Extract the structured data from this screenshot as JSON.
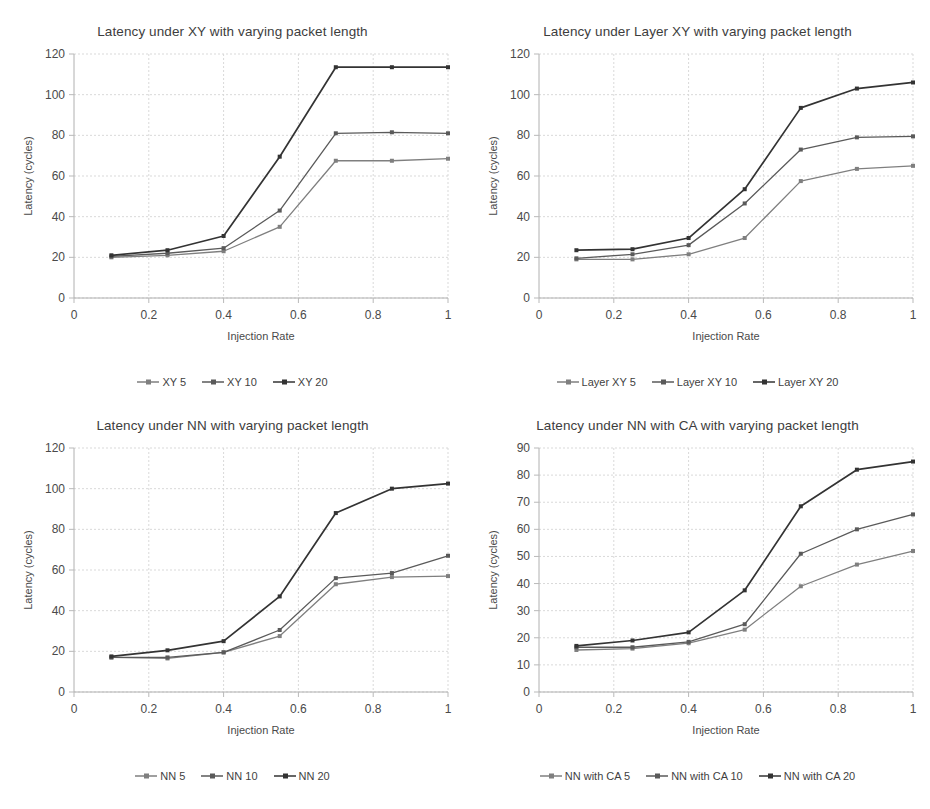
{
  "figure": {
    "background": "#ffffff",
    "series_colors": [
      "#7f7f7f",
      "#5a5a5a",
      "#333333"
    ]
  },
  "charts": [
    {
      "id": "latency-xy",
      "chart_data": {
        "type": "line",
        "title": "Latency under XY with varying packet length",
        "xlabel": "Injection Rate",
        "ylabel": "Latency (cycles)",
        "x": [
          0.1,
          0.25,
          0.4,
          0.55,
          0.7,
          0.85,
          1
        ],
        "xticks": [
          "0",
          "0.2",
          "0.4",
          "0.6",
          "0.8",
          "1"
        ],
        "xtick_values": [
          0,
          0.2,
          0.4,
          0.6,
          0.8,
          1
        ],
        "xlim": [
          0,
          1
        ],
        "yticks": [
          "0",
          "20",
          "40",
          "60",
          "80",
          "100",
          "120"
        ],
        "ytick_values": [
          0,
          20,
          40,
          60,
          80,
          100,
          120
        ],
        "ylim": [
          0,
          120
        ],
        "grid": true,
        "legend_position": "bottom",
        "series": [
          {
            "name": "XY 5",
            "values": [
              20,
              21,
              23,
              35,
              67.5,
              67.5,
              68.5
            ],
            "color": "#7f7f7f"
          },
          {
            "name": "XY 10",
            "values": [
              20.5,
              22,
              24.5,
              43,
              81,
              81.5,
              81
            ],
            "color": "#5a5a5a"
          },
          {
            "name": "XY 20",
            "values": [
              21,
              23.5,
              30.5,
              69.5,
              113.5,
              113.5,
              113.5
            ],
            "color": "#333333"
          }
        ]
      }
    },
    {
      "id": "latency-layer-xy",
      "chart_data": {
        "type": "line",
        "title": "Latency under Layer XY with varying packet length",
        "xlabel": "Injection Rate",
        "ylabel": "Latency (cycles)",
        "x": [
          0.1,
          0.25,
          0.4,
          0.55,
          0.7,
          0.85,
          1
        ],
        "xticks": [
          "0",
          "0.2",
          "0.4",
          "0.6",
          "0.8",
          "1"
        ],
        "xtick_values": [
          0,
          0.2,
          0.4,
          0.6,
          0.8,
          1
        ],
        "xlim": [
          0,
          1
        ],
        "yticks": [
          "0",
          "20",
          "40",
          "60",
          "80",
          "100",
          "120"
        ],
        "ytick_values": [
          0,
          20,
          40,
          60,
          80,
          100,
          120
        ],
        "ylim": [
          0,
          120
        ],
        "grid": true,
        "legend_position": "bottom",
        "series": [
          {
            "name": "Layer XY 5",
            "values": [
              19,
              19,
              21.5,
              29.5,
              57.5,
              63.5,
              65
            ],
            "color": "#7f7f7f"
          },
          {
            "name": "Layer XY 10",
            "values": [
              19.5,
              21.5,
              26,
              46.5,
              73,
              79,
              79.5
            ],
            "color": "#5a5a5a"
          },
          {
            "name": "Layer XY 20",
            "values": [
              23.5,
              24,
              29.5,
              53.5,
              93.5,
              103,
              106
            ],
            "color": "#333333"
          }
        ]
      }
    },
    {
      "id": "latency-nn",
      "chart_data": {
        "type": "line",
        "title": "Latency under NN with varying packet length",
        "xlabel": "Injection Rate",
        "ylabel": "Latency (cycles)",
        "x": [
          0.1,
          0.25,
          0.4,
          0.55,
          0.7,
          0.85,
          1
        ],
        "xticks": [
          "0",
          "0.2",
          "0.4",
          "0.6",
          "0.8",
          "1"
        ],
        "xtick_values": [
          0,
          0.2,
          0.4,
          0.6,
          0.8,
          1
        ],
        "xlim": [
          0,
          1
        ],
        "yticks": [
          "0",
          "20",
          "40",
          "60",
          "80",
          "100",
          "120"
        ],
        "ytick_values": [
          0,
          20,
          40,
          60,
          80,
          100,
          120
        ],
        "ylim": [
          0,
          120
        ],
        "grid": true,
        "legend_position": "bottom",
        "series": [
          {
            "name": "NN 5",
            "values": [
              17,
              16.5,
              19.5,
              27.5,
              53,
              56.5,
              57
            ],
            "color": "#7f7f7f"
          },
          {
            "name": "NN 10",
            "values": [
              17,
              17,
              19.5,
              30.5,
              56,
              58.5,
              67
            ],
            "color": "#5a5a5a"
          },
          {
            "name": "NN 20",
            "values": [
              17.5,
              20.5,
              25,
              47,
              88,
              100,
              102.5
            ],
            "color": "#333333"
          }
        ]
      }
    },
    {
      "id": "latency-nn-with-ca",
      "chart_data": {
        "type": "line",
        "title": "Latency under NN with CA with varying packet length",
        "xlabel": "Injection Rate",
        "ylabel": "Latency (cycles)",
        "x": [
          0.1,
          0.25,
          0.4,
          0.55,
          0.7,
          0.85,
          1
        ],
        "xticks": [
          "0",
          "0.2",
          "0.4",
          "0.6",
          "0.8",
          "1"
        ],
        "xtick_values": [
          0,
          0.2,
          0.4,
          0.6,
          0.8,
          1
        ],
        "xlim": [
          0,
          1
        ],
        "yticks": [
          "0",
          "10",
          "20",
          "30",
          "40",
          "50",
          "60",
          "70",
          "80",
          "90"
        ],
        "ytick_values": [
          0,
          10,
          20,
          30,
          40,
          50,
          60,
          70,
          80,
          90
        ],
        "ylim": [
          0,
          90
        ],
        "grid": true,
        "legend_position": "bottom",
        "series": [
          {
            "name": "NN with CA 5",
            "values": [
              15.5,
              16,
              18,
              23,
              39,
              47,
              52
            ],
            "color": "#7f7f7f"
          },
          {
            "name": "NN with CA 10",
            "values": [
              16.5,
              16.5,
              18.5,
              25,
              51,
              60,
              65.5
            ],
            "color": "#5a5a5a"
          },
          {
            "name": "NN with CA 20",
            "values": [
              17,
              19,
              22,
              37.5,
              68.5,
              82,
              85
            ],
            "color": "#333333"
          }
        ]
      }
    }
  ]
}
